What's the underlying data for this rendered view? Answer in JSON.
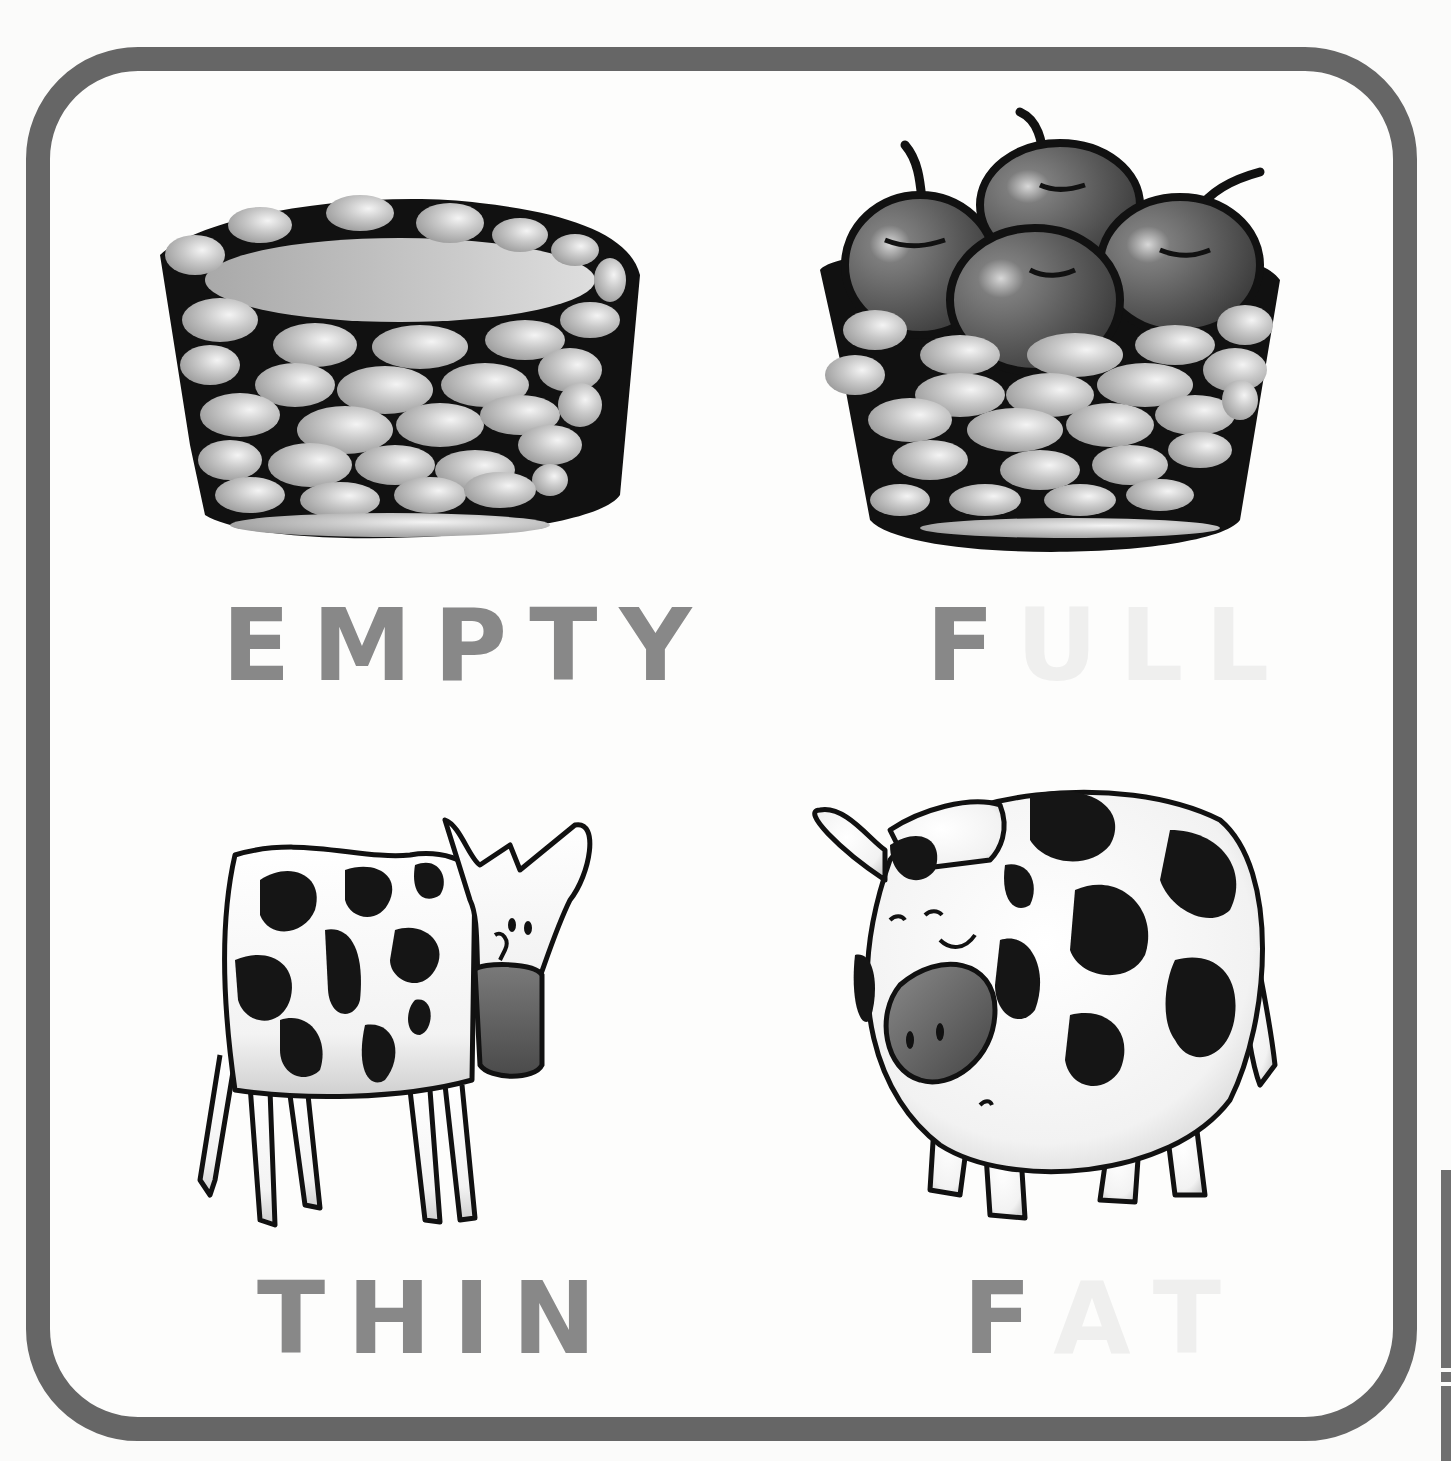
{
  "page": {
    "type": "opposites-flashcard",
    "frame_color": "#666666",
    "background": "#fdfdfc",
    "text_color": "#888888",
    "faint_text_color": "#efefee"
  },
  "cards": [
    {
      "id": "empty",
      "illustration": "empty-basket",
      "word": "EMPTY",
      "letters": [
        {
          "char": "E",
          "faint": false
        },
        {
          "char": "M",
          "faint": false
        },
        {
          "char": "P",
          "faint": false
        },
        {
          "char": "T",
          "faint": false
        },
        {
          "char": "Y",
          "faint": false
        }
      ]
    },
    {
      "id": "full",
      "illustration": "basket-of-apples",
      "word": "FULL",
      "letters": [
        {
          "char": "F",
          "faint": false
        },
        {
          "char": "U",
          "faint": true
        },
        {
          "char": "L",
          "faint": true
        },
        {
          "char": "L",
          "faint": true
        }
      ]
    },
    {
      "id": "thin",
      "illustration": "thin-cow",
      "word": "THIN",
      "letters": [
        {
          "char": "T",
          "faint": false
        },
        {
          "char": "H",
          "faint": false
        },
        {
          "char": "I",
          "faint": false
        },
        {
          "char": "N",
          "faint": false
        }
      ]
    },
    {
      "id": "fat",
      "illustration": "fat-cow",
      "word": "FAT",
      "letters": [
        {
          "char": "F",
          "faint": false
        },
        {
          "char": "A",
          "faint": true
        },
        {
          "char": "T",
          "faint": true
        }
      ]
    }
  ]
}
